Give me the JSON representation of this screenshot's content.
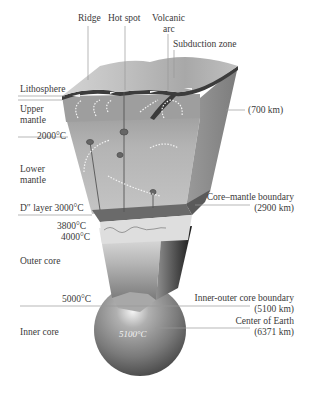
{
  "top_labels": {
    "ridge": "Ridge",
    "hot_spot": "Hot spot",
    "volcanic_arc_line1": "Volcanic",
    "volcanic_arc_line2": "arc",
    "subduction_zone": "Subduction zone"
  },
  "left_labels": {
    "lithosphere": "Lithosphere",
    "upper_mantle_line1": "Upper",
    "upper_mantle_line2": "mantle",
    "temp_2000": "2000°C",
    "lower_mantle_line1": "Lower",
    "lower_mantle_line2": "mantle",
    "d_layer": "D″ layer 3000°C",
    "temp_3800": "3800°C",
    "temp_4000": "4000°C",
    "outer_core": "Outer core",
    "temp_5000": "5000°C",
    "inner_core": "Inner core"
  },
  "right_labels": {
    "depth_700": "(700 km)",
    "core_mantle_boundary": "Core–mantle boundary",
    "depth_2900": "(2900 km)",
    "inner_outer_boundary": "Inner-outer core boundary",
    "depth_5100": "(5100 km)",
    "center_of_earth": "Center of Earth",
    "depth_6371": "(6371 km)"
  },
  "center_label": {
    "temp_center": "5100°C"
  },
  "colors": {
    "background": "#ffffff",
    "text": "#3a3a3a",
    "leader_line": "#9a9a9a",
    "crust_top": "#c8c8c8",
    "lithosphere": "#3c3c3c",
    "upper_mantle": "#9c9c9c",
    "lower_mantle": "#b8b8b8",
    "d_layer": "#6a6a6a",
    "outer_core": "#d8d8d8",
    "side_face": "#8a8a8a",
    "sphere": "#8c8c8c"
  }
}
